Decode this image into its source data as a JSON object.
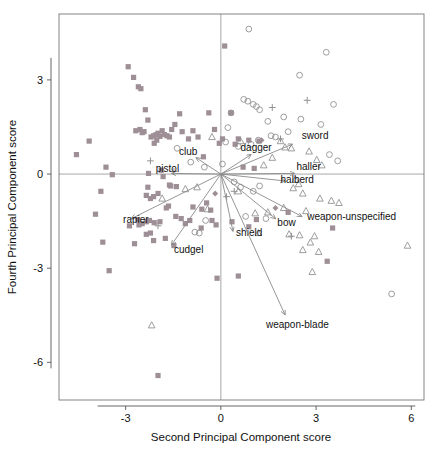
{
  "chart_data": {
    "type": "scatter",
    "title": "",
    "xlabel": "Second Principal Component score",
    "ylabel": "Fourth Principal Component score",
    "xlim": [
      -5.1,
      6.4
    ],
    "ylim": [
      -7.2,
      5.1
    ],
    "xticks": [
      -3,
      0,
      3,
      6
    ],
    "xtick_labels": [
      "-3",
      "0",
      "3",
      "6"
    ],
    "yticks": [
      3,
      0,
      -3,
      -6
    ],
    "ytick_labels": [
      "3",
      "0",
      "-3",
      "-6"
    ],
    "grid": false,
    "legend_position": "none",
    "reference_lines": {
      "x": 0,
      "y": 0
    },
    "colors": {
      "square": "#9e8e96",
      "circle": "#8c8c8c",
      "triangle": "#8c8c8c",
      "plus": "#8c8c8c",
      "diamond": "#9e8e96",
      "arrow": "#8a8a8a",
      "axis": "#5a5a5a",
      "text": "#111111"
    },
    "series": [
      {
        "name": "square",
        "marker": "filled-square",
        "points": [
          [
            -4.55,
            0.62
          ],
          [
            -4.15,
            1.05
          ],
          [
            -3.62,
            0.22
          ],
          [
            -3.42,
            -0.02
          ],
          [
            -3.78,
            -0.55
          ],
          [
            -3.95,
            -1.28
          ],
          [
            -3.72,
            -2.17
          ],
          [
            -3.52,
            -3.08
          ],
          [
            -2.92,
            3.42
          ],
          [
            -2.75,
            3.08
          ],
          [
            -2.6,
            2.78
          ],
          [
            -2.52,
            2.72
          ],
          [
            -2.38,
            2.05
          ],
          [
            -2.42,
            1.35
          ],
          [
            -2.48,
            1.32
          ],
          [
            -2.3,
            1.72
          ],
          [
            -2.2,
            1.18
          ],
          [
            -2.12,
            1.22
          ],
          [
            -2.05,
            1.25
          ],
          [
            -1.98,
            1.3
          ],
          [
            -1.92,
            1.2
          ],
          [
            -1.85,
            1.38
          ],
          [
            -1.78,
            1.26
          ],
          [
            -1.7,
            1.22
          ],
          [
            -1.62,
            1.18
          ],
          [
            -2.02,
            1.08
          ],
          [
            -2.1,
            0.98
          ],
          [
            -1.55,
            1.42
          ],
          [
            -1.45,
            1.58
          ],
          [
            -1.3,
            1.92
          ],
          [
            -1.22,
            1.35
          ],
          [
            -0.88,
            1.38
          ],
          [
            -0.38,
            1.95
          ],
          [
            -0.2,
            1.42
          ],
          [
            0.12,
            4.08
          ],
          [
            0.32,
            1.95
          ],
          [
            0.55,
            1.12
          ],
          [
            0.88,
            1.08
          ],
          [
            1.2,
            1.05
          ],
          [
            0.7,
            0.22
          ],
          [
            -2.28,
            0.02
          ],
          [
            -2.3,
            -0.42
          ],
          [
            -2.35,
            -0.68
          ],
          [
            -2.22,
            -0.78
          ],
          [
            -2.12,
            -0.72
          ],
          [
            -1.98,
            -0.62
          ],
          [
            -1.62,
            -0.35
          ],
          [
            -1.58,
            -0.38
          ],
          [
            -1.4,
            -0.4
          ],
          [
            -1.65,
            -1.02
          ],
          [
            -1.72,
            -1.08
          ],
          [
            -1.42,
            -1.35
          ],
          [
            -1.25,
            -1.42
          ],
          [
            -1.92,
            -1.52
          ],
          [
            -2.1,
            -1.55
          ],
          [
            -2.25,
            -1.48
          ],
          [
            -2.35,
            -1.52
          ],
          [
            -2.48,
            -1.58
          ],
          [
            -2.58,
            -1.62
          ],
          [
            -2.62,
            -1.45
          ],
          [
            -2.22,
            -1.88
          ],
          [
            -2.35,
            -1.92
          ],
          [
            -2.12,
            -2.12
          ],
          [
            -1.75,
            -2.05
          ],
          [
            -1.48,
            -2.28
          ],
          [
            -2.72,
            -2.22
          ],
          [
            -2.88,
            -1.65
          ],
          [
            -0.98,
            -1.48
          ],
          [
            -0.88,
            -1.05
          ],
          [
            -0.6,
            -1.12
          ],
          [
            -0.62,
            -1.72
          ],
          [
            -0.45,
            -0.92
          ],
          [
            -0.32,
            -1.15
          ],
          [
            -0.28,
            -1.48
          ],
          [
            -0.15,
            -1.62
          ],
          [
            0.35,
            -1.52
          ],
          [
            0.88,
            -1.68
          ],
          [
            1.12,
            -1.45
          ],
          [
            -0.12,
            -3.32
          ],
          [
            0.55,
            -3.25
          ],
          [
            -1.98,
            -6.42
          ],
          [
            3.35,
            -2.78
          ],
          [
            3.52,
            -1.72
          ],
          [
            2.12,
            -1.22
          ],
          [
            -2.55,
            1.42
          ],
          [
            -2.68,
            1.38
          ],
          [
            -1.12,
            -1.58
          ],
          [
            -0.55,
            0.55
          ],
          [
            -1.02,
            1.12
          ],
          [
            -0.72,
            1.18
          ],
          [
            0.05,
            1.12
          ],
          [
            -0.05,
            0.98
          ],
          [
            0.45,
            0.95
          ],
          [
            1.05,
            0.18
          ],
          [
            -1.82,
            -0.08
          ],
          [
            -1.88,
            0.12
          ]
        ]
      },
      {
        "name": "circle",
        "marker": "open-circle",
        "points": [
          [
            0.88,
            4.62
          ],
          [
            3.32,
            3.88
          ],
          [
            2.48,
            3.15
          ],
          [
            3.55,
            2.22
          ],
          [
            0.72,
            2.38
          ],
          [
            0.85,
            2.32
          ],
          [
            1.02,
            2.22
          ],
          [
            1.12,
            2.15
          ],
          [
            1.22,
            2.05
          ],
          [
            0.32,
            1.95
          ],
          [
            1.48,
            1.68
          ],
          [
            1.98,
            1.82
          ],
          [
            2.52,
            1.75
          ],
          [
            3.15,
            1.58
          ],
          [
            2.12,
            1.35
          ],
          [
            1.58,
            1.22
          ],
          [
            1.72,
            1.18
          ],
          [
            0.22,
            1.48
          ],
          [
            -1.38,
            0.82
          ],
          [
            -0.95,
            0.38
          ],
          [
            0.15,
            1.02
          ],
          [
            0.55,
            0.88
          ],
          [
            0.95,
            0.95
          ],
          [
            1.18,
            1.08
          ],
          [
            3.42,
            0.62
          ],
          [
            3.68,
            0.42
          ],
          [
            0.42,
            -0.25
          ],
          [
            0.62,
            -0.42
          ],
          [
            1.02,
            -0.55
          ],
          [
            1.22,
            -0.38
          ],
          [
            0.78,
            -1.35
          ],
          [
            -0.48,
            -1.48
          ],
          [
            -0.82,
            -1.85
          ],
          [
            -0.68,
            -1.88
          ],
          [
            1.42,
            -1.42
          ],
          [
            5.38,
            -3.82
          ],
          [
            -0.52,
            0.22
          ],
          [
            0.05,
            0.32
          ]
        ]
      },
      {
        "name": "triangle",
        "marker": "open-triangle",
        "points": [
          [
            -0.28,
            1.18
          ],
          [
            0.62,
            1.05
          ],
          [
            2.22,
            0.82
          ],
          [
            2.78,
            0.72
          ],
          [
            3.02,
            0.45
          ],
          [
            3.18,
            0.28
          ],
          [
            1.62,
            0.52
          ],
          [
            1.88,
            1.05
          ],
          [
            2.02,
            0.85
          ],
          [
            2.35,
            -0.18
          ],
          [
            2.45,
            -0.32
          ],
          [
            2.28,
            -0.45
          ],
          [
            2.58,
            -0.62
          ],
          [
            3.12,
            -0.78
          ],
          [
            3.48,
            -0.85
          ],
          [
            3.72,
            -0.92
          ],
          [
            1.98,
            -1.08
          ],
          [
            2.68,
            -1.18
          ],
          [
            1.48,
            -1.22
          ],
          [
            1.08,
            -1.25
          ],
          [
            -0.42,
            -1.12
          ],
          [
            -1.85,
            -0.78
          ],
          [
            -1.12,
            -0.48
          ],
          [
            -0.75,
            -0.42
          ],
          [
            2.15,
            -1.92
          ],
          [
            2.48,
            -1.95
          ],
          [
            2.95,
            -1.98
          ],
          [
            2.82,
            -2.18
          ],
          [
            2.58,
            -2.42
          ],
          [
            3.08,
            -2.48
          ],
          [
            2.88,
            -3.12
          ],
          [
            5.88,
            -2.28
          ],
          [
            -2.18,
            -4.82
          ],
          [
            1.18,
            -1.88
          ],
          [
            0.55,
            -0.55
          ],
          [
            1.35,
            0.28
          ]
        ]
      },
      {
        "name": "plus",
        "marker": "plus",
        "points": [
          [
            1.62,
            2.12
          ],
          [
            2.72,
            2.35
          ],
          [
            -2.22,
            0.42
          ],
          [
            -1.48,
            0.08
          ],
          [
            0.42,
            -0.55
          ],
          [
            0.18,
            -0.72
          ],
          [
            -1.98,
            -1.65
          ],
          [
            2.22,
            -1.98
          ],
          [
            1.88,
            1.12
          ]
        ]
      },
      {
        "name": "diamond",
        "marker": "filled-diamond",
        "points": [
          [
            1.28,
            1.08
          ],
          [
            1.72,
            -1.08
          ],
          [
            -0.18,
            -0.62
          ]
        ]
      }
    ],
    "vectors": [
      {
        "label": "sword",
        "x": 2.25,
        "y": 0.95,
        "label_x": 2.55,
        "label_y": 1.12,
        "anchor": "start"
      },
      {
        "label": "dagger",
        "x": 0.95,
        "y": 0.62,
        "label_x": 0.62,
        "label_y": 0.72,
        "anchor": "start"
      },
      {
        "label": "club",
        "x": -0.78,
        "y": 0.52,
        "label_x": -1.32,
        "label_y": 0.62,
        "anchor": "start"
      },
      {
        "label": "pistol",
        "x": -1.55,
        "y": 0.02,
        "label_x": -2.05,
        "label_y": 0.05,
        "anchor": "start"
      },
      {
        "label": "haller",
        "x": 2.32,
        "y": 0.02,
        "label_x": 2.38,
        "label_y": 0.12,
        "anchor": "start"
      },
      {
        "label": "halberd",
        "x": 2.02,
        "y": -0.22,
        "label_x": 1.88,
        "label_y": -0.28,
        "anchor": "start"
      },
      {
        "label": "weapon-unspecified",
        "x": 2.55,
        "y": -1.35,
        "label_x": 2.72,
        "label_y": -1.45,
        "anchor": "start"
      },
      {
        "label": "bow",
        "x": 1.72,
        "y": -1.42,
        "label_x": 1.78,
        "label_y": -1.65,
        "anchor": "start"
      },
      {
        "label": "shield",
        "x": 0.38,
        "y": -1.82,
        "label_x": 0.48,
        "label_y": -1.98,
        "anchor": "start"
      },
      {
        "label": "cudgel",
        "x": -1.55,
        "y": -2.25,
        "label_x": -1.48,
        "label_y": -2.52,
        "anchor": "start"
      },
      {
        "label": "rapier",
        "x": -2.82,
        "y": -1.42,
        "label_x": -3.08,
        "label_y": -1.55,
        "anchor": "start"
      },
      {
        "label": "weapon-blade",
        "x": 2.02,
        "y": -4.48,
        "label_x": 1.42,
        "label_y": -4.92,
        "anchor": "start"
      }
    ]
  }
}
